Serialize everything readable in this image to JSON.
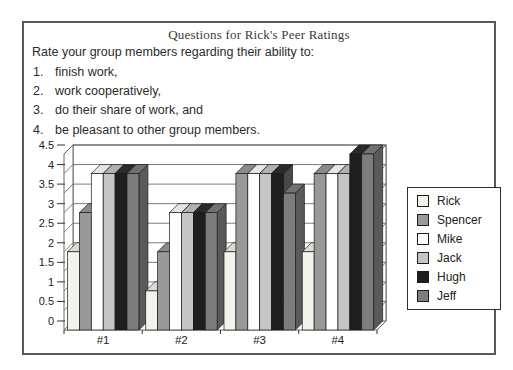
{
  "figure": {
    "title": "Questions for Rick's Peer Ratings",
    "prompt": "Rate your group members regarding their ability to:",
    "list_items": [
      "finish work,",
      "work cooperatively,",
      "do their share of work, and",
      "be pleasant to other group members."
    ]
  },
  "chart_data": {
    "type": "bar",
    "subtype": "3d-column",
    "categories": [
      "#1",
      "#2",
      "#3",
      "#4"
    ],
    "series": [
      {
        "name": "Rick",
        "color": "#f3f2ed",
        "values": [
          2,
          1,
          2,
          2
        ]
      },
      {
        "name": "Spencer",
        "color": "#999999",
        "values": [
          3,
          2,
          4,
          4
        ]
      },
      {
        "name": "Mike",
        "color": "#ffffff",
        "values": [
          4,
          3,
          4,
          4
        ]
      },
      {
        "name": "Jack",
        "color": "#c5c5c5",
        "values": [
          4,
          3,
          4,
          4
        ]
      },
      {
        "name": "Hugh",
        "color": "#1e1e1e",
        "values": [
          4,
          3,
          4,
          4.5
        ]
      },
      {
        "name": "Jeff",
        "color": "#7d7d7d",
        "values": [
          4,
          3,
          3.5,
          4.5
        ]
      }
    ],
    "title": "",
    "xlabel": "",
    "ylabel": "",
    "ylim": [
      0,
      4.5
    ],
    "ytick_step": 0.5,
    "yticks": [
      "0",
      "0.5",
      "1",
      "1.5",
      "2",
      "2.5",
      "3",
      "3.5",
      "4",
      "4.5"
    ],
    "grid": true,
    "legend_position": "right",
    "wall_color": "#ffffff",
    "line_color": "#5a5a5a"
  }
}
